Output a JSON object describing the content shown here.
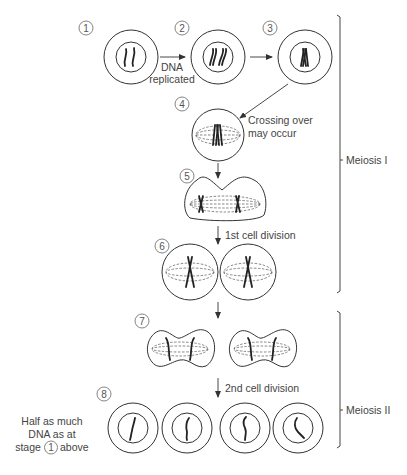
{
  "stages": [
    {
      "id": 1,
      "label": "1"
    },
    {
      "id": 2,
      "label": "2"
    },
    {
      "id": 3,
      "label": "3"
    },
    {
      "id": 4,
      "label": "4"
    },
    {
      "id": 5,
      "label": "5"
    },
    {
      "id": 6,
      "label": "6"
    },
    {
      "id": 7,
      "label": "7"
    },
    {
      "id": 8,
      "label": "8"
    }
  ],
  "annotations": {
    "dna_replicated_line1": "DNA",
    "dna_replicated_line2": "replicated",
    "crossing_over_line1": "Crossing over",
    "crossing_over_line2": "may occur",
    "first_division": "1st cell division",
    "second_division": "2nd cell division",
    "half_dna_line1": "Half as much",
    "half_dna_line2": "DNA as at",
    "half_dna_line3_pre": "stage",
    "half_dna_line3_ref": "1",
    "half_dna_line3_post": "above"
  },
  "phases": {
    "meiosis_1": "Meiosis I",
    "meiosis_2": "Meiosis II"
  }
}
